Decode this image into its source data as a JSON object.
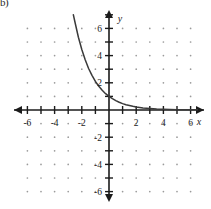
{
  "figure": {
    "corner_label": "b)",
    "background_color": "#ffffff",
    "axis_color": "#1b1b1b",
    "grid_dot_color": "#9a9a9a",
    "curve_color": "#3a3a3a"
  },
  "axes": {
    "x_axis_label": "x",
    "y_axis_label": "y",
    "x_tick_labels": [
      "-6",
      "-4",
      "-2",
      "2",
      "4",
      "6"
    ],
    "y_tick_labels": [
      "6",
      "4",
      "2",
      "-2",
      "-4",
      "-6"
    ],
    "x_tick_values": [
      -6,
      -4,
      -2,
      2,
      4,
      6
    ],
    "y_tick_values": [
      6,
      4,
      2,
      -2,
      -4,
      -6
    ],
    "x_minor_ticks": [
      -7,
      -6,
      -5,
      -4,
      -3,
      -2,
      -1,
      1,
      2,
      3,
      4,
      5,
      6,
      7
    ],
    "y_minor_ticks": [
      -7,
      -6,
      -5,
      -4,
      -3,
      -2,
      -1,
      1,
      2,
      3,
      4,
      5,
      6,
      7
    ],
    "x_arrow_both_ends": true,
    "y_arrow_both_ends": true
  },
  "chart_data": {
    "type": "line",
    "title": "",
    "subtitle": "",
    "xlabel": "x",
    "ylabel": "y",
    "xlim": [
      -7.2,
      7.2
    ],
    "ylim": [
      -7.2,
      7.2
    ],
    "grid": true,
    "grid_style": "dots",
    "legend": null,
    "legend_position": "none",
    "xticks": [
      -6,
      -4,
      -2,
      2,
      4,
      6
    ],
    "yticks": [
      6,
      4,
      2,
      -2,
      -4,
      -6
    ],
    "annotations": [],
    "series": [
      {
        "name": "exponential decay",
        "description": "Decreasing exponential curve passing through (0, 1), asymptotic to y = 0 for large positive x, rising steeply for negative x; leaves the top of the grid near x = -2.6 at y = 7.",
        "x": [
          -2.62,
          -2.5,
          -2.25,
          -2.0,
          -1.75,
          -1.5,
          -1.25,
          -1.0,
          -0.75,
          -0.5,
          -0.25,
          0.0,
          0.25,
          0.5,
          0.75,
          1.0,
          1.25,
          1.5,
          1.75,
          2.0,
          2.5,
          3.0,
          3.5,
          4.0,
          4.5,
          5.0,
          5.5,
          6.0,
          6.5
        ],
        "y": [
          7.0,
          6.45,
          5.35,
          4.45,
          3.7,
          3.05,
          2.55,
          2.1,
          1.75,
          1.45,
          1.2,
          1.0,
          0.83,
          0.69,
          0.57,
          0.47,
          0.39,
          0.33,
          0.27,
          0.22,
          0.15,
          0.11,
          0.07,
          0.05,
          0.035,
          0.025,
          0.02,
          0.015,
          0.012
        ]
      }
    ]
  }
}
